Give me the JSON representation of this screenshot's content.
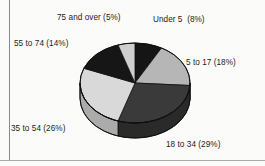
{
  "figure": {
    "kind": "pie-chart-3d",
    "background_color": "#fbfbfa",
    "rule_color": "#8a8a8a"
  },
  "chart_data": {
    "type": "pie",
    "title": "",
    "subtitle": "",
    "xlabel": "",
    "ylabel": "",
    "grid": false,
    "legend_position": "none",
    "label_style": "callout-outside",
    "start_angle_deg": 0,
    "direction": "clockwise",
    "categories": [
      "Under 5",
      "5 to 17",
      "18 to 34",
      "35 to 54",
      "55 to 74",
      "75 and over"
    ],
    "values": [
      8,
      18,
      29,
      26,
      14,
      5
    ],
    "units": "percent",
    "labels": [
      "Under 5  (8%)",
      "5 to 17 (18%)",
      "18 to 34 (29%)",
      "35 to 54 (26%)",
      "55 to 74 (14%)",
      "75 and over (5%)"
    ],
    "slice_colors": [
      "#151515",
      "#b6b6b6",
      "#3a3a3a",
      "#d9d9d9",
      "#161616",
      "#cfcfcf"
    ],
    "side_colors": [
      "#0d0d0d",
      "#8f8f8f",
      "#2a2a2a",
      "#ababab",
      "#0e0e0e",
      "#a5a5a5"
    ],
    "slices": [
      {
        "name": "Under 5",
        "label": "Under 5  (8%)",
        "value": 8,
        "color": "#151515"
      },
      {
        "name": "5 to 17",
        "label": "5 to 17 (18%)",
        "value": 18,
        "color": "#b6b6b6"
      },
      {
        "name": "18 to 34",
        "label": "18 to 34 (29%)",
        "value": 29,
        "color": "#3a3a3a"
      },
      {
        "name": "35 to 54",
        "label": "35 to 54 (26%)",
        "value": 26,
        "color": "#d9d9d9"
      },
      {
        "name": "55 to 74",
        "label": "55 to 74 (14%)",
        "value": 14,
        "color": "#161616"
      },
      {
        "name": "75 and over",
        "label": "75 and over (5%)",
        "value": 5,
        "color": "#cfcfcf"
      }
    ]
  }
}
